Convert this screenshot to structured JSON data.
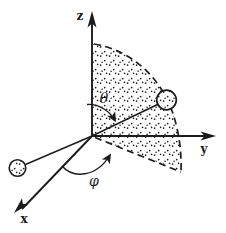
{
  "labels": {
    "z_axis": "z",
    "y_axis": "y",
    "x_axis": "x",
    "polar_angle": "θ",
    "azimuthal_angle": "φ"
  },
  "colors": {
    "ink": "#1c1c1c",
    "background": "#ffffff"
  },
  "figure": {
    "type": "spherical-coordinates-diagram",
    "elements": [
      "z-axis-arrow",
      "y-axis-arrow",
      "x-axis-arrow",
      "stippled-sector-with-dashed-arc",
      "radius-vector-to-particle",
      "particle-on-arc",
      "particle-lower-left",
      "theta-angle-arc",
      "phi-angle-arc"
    ]
  }
}
